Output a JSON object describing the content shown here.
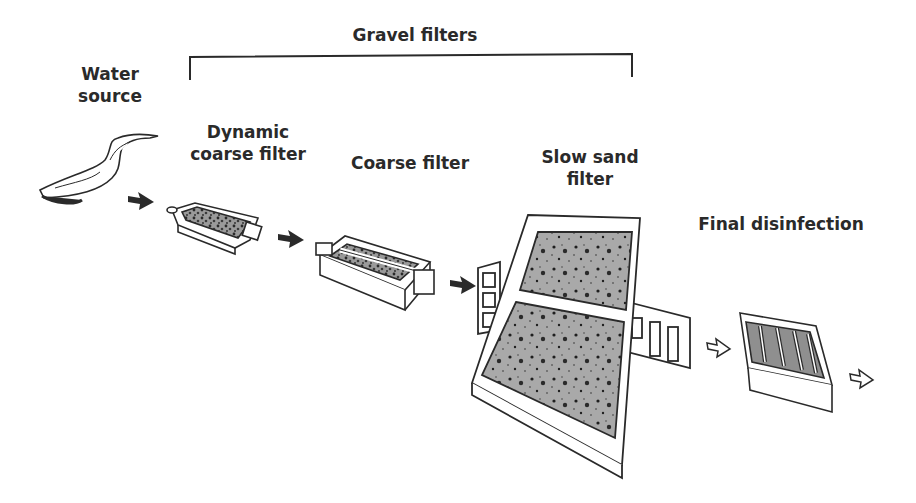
{
  "diagram": {
    "group_label": "Gravel filters",
    "stages": [
      {
        "id": "water-source",
        "label": "Water\nsource"
      },
      {
        "id": "dynamic-coarse-filter",
        "label": "Dynamic\ncoarse filter"
      },
      {
        "id": "coarse-filter",
        "label": "Coarse filter"
      },
      {
        "id": "slow-sand-filter",
        "label": "Slow sand\nfilter"
      },
      {
        "id": "final-disinfection",
        "label": "Final disinfection"
      }
    ],
    "flow": [
      {
        "from": "water-source",
        "to": "dynamic-coarse-filter",
        "style": "solid"
      },
      {
        "from": "dynamic-coarse-filter",
        "to": "coarse-filter",
        "style": "solid"
      },
      {
        "from": "coarse-filter",
        "to": "slow-sand-filter",
        "style": "solid"
      },
      {
        "from": "slow-sand-filter",
        "to": "final-disinfection",
        "style": "outline"
      },
      {
        "from": "final-disinfection",
        "to": "output",
        "style": "outline"
      }
    ],
    "colors": {
      "ink": "#2a2a2a",
      "sand": "#a9a9a9",
      "gravel": "#8c8c8c",
      "background": "#ffffff"
    }
  }
}
